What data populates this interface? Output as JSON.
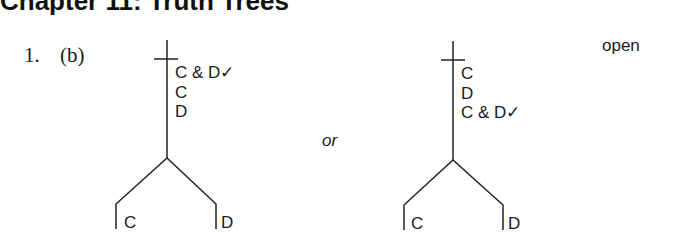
{
  "header": {
    "title": "Chapter 11: Truth Trees"
  },
  "exercise": {
    "number": "1.",
    "part": "(b)",
    "separator": "or",
    "status": "open"
  },
  "tree_left": {
    "trunk": [
      "C & D✓",
      "C",
      "D"
    ],
    "branches": [
      "C",
      "D"
    ]
  },
  "tree_right": {
    "trunk": [
      "C",
      "D",
      "C & D✓"
    ],
    "branches": [
      "C",
      "D"
    ]
  },
  "colors": {
    "ink": "#1a1a1a",
    "background": "#ffffff"
  }
}
